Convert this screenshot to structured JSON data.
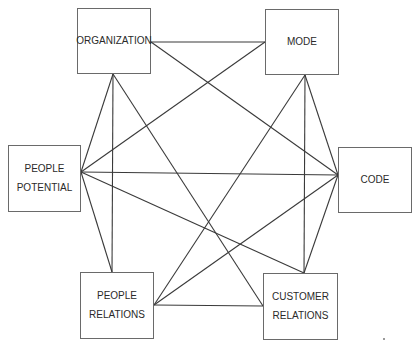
{
  "diagram": {
    "type": "network",
    "colors": {
      "line": "#3a3a3a",
      "box_border": "#6a6a6a",
      "text": "#2a2a2a",
      "background": "#ffffff"
    },
    "nodes": [
      {
        "id": "organization",
        "lines": [
          "ORGANIZATION"
        ],
        "x": 77,
        "y": 8,
        "w": 74,
        "h": 66
      },
      {
        "id": "mode",
        "lines": [
          "MODE"
        ],
        "x": 265,
        "y": 9,
        "w": 74,
        "h": 66
      },
      {
        "id": "people-potential",
        "lines": [
          "PEOPLE",
          "POTENTIAL"
        ],
        "x": 8,
        "y": 145,
        "w": 73,
        "h": 67
      },
      {
        "id": "code",
        "lines": [
          "CODE"
        ],
        "x": 338,
        "y": 147,
        "w": 74,
        "h": 66
      },
      {
        "id": "people-relations",
        "lines": [
          "PEOPLE",
          "RELATIONS"
        ],
        "x": 80,
        "y": 272,
        "w": 74,
        "h": 67
      },
      {
        "id": "customer-relations",
        "lines": [
          "CUSTOMER",
          "RELATIONS"
        ],
        "x": 263,
        "y": 273,
        "w": 75,
        "h": 67
      }
    ],
    "edges": [
      {
        "from": "organization",
        "to": "mode",
        "x1": 151,
        "y1": 42,
        "x2": 265,
        "y2": 42
      },
      {
        "from": "organization",
        "to": "people-potential",
        "x1": 113,
        "y1": 74,
        "x2": 81,
        "y2": 172
      },
      {
        "from": "organization",
        "to": "people-relations",
        "x1": 113,
        "y1": 74,
        "x2": 112,
        "y2": 272
      },
      {
        "from": "organization",
        "to": "customer-relations",
        "x1": 113,
        "y1": 74,
        "x2": 263,
        "y2": 306
      },
      {
        "from": "organization",
        "to": "code",
        "x1": 151,
        "y1": 42,
        "x2": 338,
        "y2": 175
      },
      {
        "from": "mode",
        "to": "people-potential",
        "x1": 265,
        "y1": 42,
        "x2": 81,
        "y2": 172
      },
      {
        "from": "mode",
        "to": "people-relations",
        "x1": 305,
        "y1": 75,
        "x2": 154,
        "y2": 305
      },
      {
        "from": "mode",
        "to": "customer-relations",
        "x1": 305,
        "y1": 75,
        "x2": 304,
        "y2": 273
      },
      {
        "from": "mode",
        "to": "code",
        "x1": 305,
        "y1": 75,
        "x2": 338,
        "y2": 175
      },
      {
        "from": "people-potential",
        "to": "code",
        "x1": 81,
        "y1": 172,
        "x2": 338,
        "y2": 175
      },
      {
        "from": "people-potential",
        "to": "people-relations",
        "x1": 81,
        "y1": 172,
        "x2": 112,
        "y2": 272
      },
      {
        "from": "people-potential",
        "to": "customer-relations",
        "x1": 81,
        "y1": 172,
        "x2": 304,
        "y2": 273
      },
      {
        "from": "code",
        "to": "people-relations",
        "x1": 338,
        "y1": 175,
        "x2": 154,
        "y2": 305
      },
      {
        "from": "code",
        "to": "customer-relations",
        "x1": 338,
        "y1": 175,
        "x2": 304,
        "y2": 273
      },
      {
        "from": "people-relations",
        "to": "customer-relations",
        "x1": 154,
        "y1": 305,
        "x2": 263,
        "y2": 306
      }
    ]
  }
}
